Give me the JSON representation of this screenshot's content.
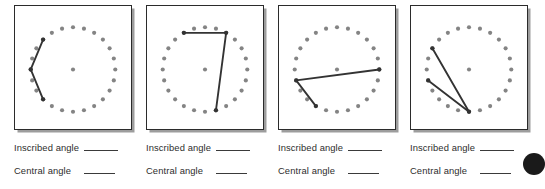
{
  "worksheet": {
    "title": "Inscribed and Central Angles Practice",
    "dot_color": "#848484",
    "line_color": "#333333",
    "box_border_color": "#2b2b2b",
    "shadow_color": "#9d9d9d",
    "corner_mark_color": "#1a1a1a",
    "dots_per_circle": 24,
    "labels": {
      "inscribed": "Inscribed angle",
      "central": "Central angle",
      "blank": "______"
    },
    "problems": [
      {
        "number": "1",
        "left": 10,
        "center_dot": true,
        "vertex_index": 18,
        "arm_indices": [
          15,
          21
        ],
        "inscribed_label": "Inscribed angle",
        "central_label": "Central angle",
        "inscribed_answer": "",
        "central_answer": ""
      },
      {
        "number": "2",
        "left": 142,
        "center_dot": true,
        "vertex_index": 2,
        "arm_indices": [
          22,
          11
        ],
        "inscribed_label": "Inscribed angle",
        "central_label": "Central angle",
        "inscribed_answer": "",
        "central_answer": ""
      },
      {
        "number": "3",
        "left": 274,
        "center_dot": true,
        "vertex_index": 17,
        "arm_indices": [
          6,
          14
        ],
        "inscribed_label": "Inscribed angle",
        "central_label": "Central angle",
        "inscribed_answer": "",
        "central_answer": ""
      },
      {
        "number": "4",
        "left": 406,
        "center_dot": true,
        "vertex_index": 12,
        "arm_indices": [
          20,
          17
        ],
        "inscribed_label": "Inscribed angle",
        "central_label": "Central angle",
        "inscribed_answer": "",
        "central_answer": ""
      }
    ]
  }
}
